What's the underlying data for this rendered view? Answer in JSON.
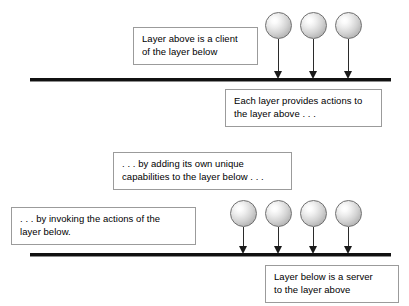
{
  "diagram": {
    "background_color": "#ffffff",
    "line_color": "#111111",
    "sphere_fill_light": "#ffffff",
    "sphere_fill_dark": "#9a9a9a",
    "box_border_color": "#9b9b9b",
    "text_color": "#000000"
  },
  "layers": [
    {
      "name": "upper-layer-boundary",
      "label": ""
    },
    {
      "name": "lower-layer-boundary",
      "label": ""
    }
  ],
  "captions": [
    {
      "id": "client",
      "lines": [
        "Layer above is a client",
        "of the layer below"
      ]
    },
    {
      "id": "provides",
      "lines": [
        "Each layer provides actions to",
        "the layer above . . ."
      ]
    },
    {
      "id": "adding",
      "lines": [
        ". . . by adding its own unique",
        "capabilities to the layer below . . ."
      ]
    },
    {
      "id": "invoking",
      "lines": [
        ". . . by invoking the actions of the",
        "layer below."
      ]
    },
    {
      "id": "server",
      "lines": [
        "Layer below is a server",
        "to the layer above"
      ]
    }
  ],
  "sphere_groups": [
    {
      "id": "upper-spheres",
      "count": 3,
      "positions_x": [
        265,
        300,
        335
      ],
      "top": 12,
      "arrow_top": 39,
      "arrow_height": 40
    },
    {
      "id": "lower-spheres",
      "count": 4,
      "positions_x": [
        230,
        265,
        300,
        335
      ],
      "top": 200,
      "arrow_top": 227,
      "arrow_height": 27
    }
  ]
}
